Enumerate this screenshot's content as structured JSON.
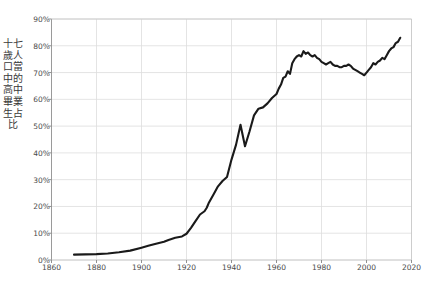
{
  "chart_data": {
    "type": "line",
    "title": "",
    "subtitle": "",
    "xlabel": "",
    "ylabel": "十七歲人口當中的高中畢業生占比",
    "xlim": [
      1860,
      2020
    ],
    "ylim": [
      0,
      90
    ],
    "grid": true,
    "legend": null,
    "y_tick_labels": [
      "0%",
      "10%",
      "20%",
      "30%",
      "40%",
      "50%",
      "60%",
      "70%",
      "80%",
      "90%"
    ],
    "y_tick_values": [
      0,
      10,
      20,
      30,
      40,
      50,
      60,
      70,
      80,
      90
    ],
    "x_tick_labels": [
      "1860",
      "1880",
      "1900",
      "1920",
      "1940",
      "1960",
      "1980",
      "2000",
      "2020"
    ],
    "x_tick_values": [
      1860,
      1880,
      1900,
      1920,
      1940,
      1960,
      1980,
      2000,
      2020
    ],
    "line_color": "#1a1a1a",
    "grid_color": "#dddddd",
    "series": [
      {
        "name": "高中畢業生占比",
        "x": [
          1870,
          1875,
          1880,
          1885,
          1890,
          1895,
          1900,
          1903,
          1906,
          1910,
          1912,
          1915,
          1918,
          1920,
          1922,
          1924,
          1926,
          1928,
          1929,
          1930,
          1932,
          1934,
          1936,
          1938,
          1940,
          1942,
          1944,
          1946,
          1948,
          1950,
          1952,
          1954,
          1956,
          1958,
          1960,
          1961,
          1962,
          1963,
          1964,
          1965,
          1966,
          1967,
          1968,
          1969,
          1970,
          1971,
          1972,
          1973,
          1974,
          1975,
          1976,
          1977,
          1978,
          1979,
          1980,
          1981,
          1982,
          1983,
          1984,
          1985,
          1986,
          1987,
          1988,
          1989,
          1990,
          1991,
          1992,
          1993,
          1994,
          1995,
          1996,
          1997,
          1998,
          1999,
          2000,
          2001,
          2002,
          2003,
          2004,
          2005,
          2006,
          2007,
          2008,
          2009,
          2010,
          2011,
          2012,
          2013,
          2014,
          2015
        ],
        "y": [
          2.0,
          2.1,
          2.2,
          2.4,
          2.9,
          3.5,
          4.6,
          5.3,
          6.0,
          6.8,
          7.5,
          8.3,
          8.8,
          9.8,
          12.0,
          14.5,
          17.0,
          18.2,
          19.5,
          21.5,
          24.5,
          27.5,
          29.5,
          31.0,
          37.5,
          43.0,
          50.5,
          42.5,
          48.0,
          54.0,
          56.5,
          57.0,
          58.5,
          60.5,
          62.0,
          64.0,
          65.5,
          68.0,
          68.5,
          70.5,
          69.5,
          73.5,
          75.0,
          76.0,
          76.5,
          76.0,
          78.0,
          77.0,
          77.5,
          76.5,
          76.0,
          76.5,
          75.5,
          75.0,
          74.0,
          73.5,
          73.0,
          73.5,
          74.0,
          73.0,
          72.5,
          72.5,
          72.0,
          72.0,
          72.5,
          72.5,
          73.0,
          72.5,
          71.5,
          71.0,
          70.5,
          70.0,
          69.5,
          69.0,
          70.0,
          71.0,
          72.0,
          73.5,
          73.0,
          74.0,
          74.5,
          75.5,
          75.0,
          76.5,
          78.0,
          79.0,
          79.5,
          81.0,
          81.5,
          83.0
        ]
      }
    ]
  },
  "axis": {
    "y_label_text": "十七歲人口當中的高中畢業生占比"
  }
}
